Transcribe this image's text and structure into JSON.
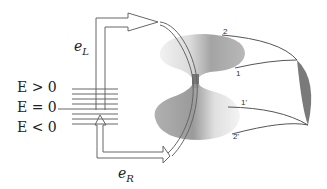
{
  "diagram": {
    "energy_labels": {
      "positive": "E > 0",
      "zero": "E = 0",
      "negative": "E < 0"
    },
    "channel_labels": {
      "left_mover": {
        "base": "e",
        "sub": "L"
      },
      "right_mover": {
        "base": "e",
        "sub": "R"
      }
    },
    "edge_labels": {
      "top_outer": "2",
      "top_inner": "1",
      "bottom_inner": "1'",
      "bottom_outer": "2'"
    },
    "colors": {
      "line": "#666666",
      "cone_dark": "#8a8a8a",
      "cone_light": "#e6e6e6",
      "ribbon": "#7a7a7a",
      "background": "#ffffff"
    }
  }
}
